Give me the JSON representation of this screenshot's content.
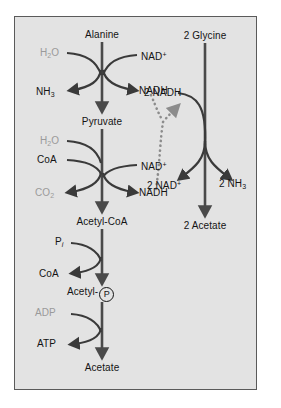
{
  "figure": {
    "panel": {
      "background_color": "#e3e3e3",
      "border_color": "#5a5a5a",
      "page_background": "#ffffff"
    },
    "colors": {
      "arrow_main": "#4a4a4a",
      "arrow_branch": "#3a3a3a",
      "text_primary": "#141414",
      "text_secondary_gray": "#9a9a9a",
      "dotted_connector": "#8c8c8c"
    },
    "pathways": {
      "left": {
        "name": "alanine-to-acetate-pathway",
        "metabolites": [
          {
            "id": "alanine",
            "label": "Alanine"
          },
          {
            "id": "pyruvate",
            "label": "Pyruvate"
          },
          {
            "id": "acetyl-coa",
            "label": "Acetyl-CoA"
          },
          {
            "id": "acetyl-phosphate",
            "label": "Acetyl-",
            "circle_glyph": "P"
          },
          {
            "id": "acetate",
            "label": "Acetate"
          }
        ],
        "steps": [
          {
            "id": "alanine-dehydrogenase",
            "substrate_in_left": "H2O",
            "substrate_in_left_html": "H<sub>2</sub>O",
            "substrate_in_right": "NAD+",
            "substrate_in_right_html": "NAD<sup>+</sup>",
            "product_out_left": "NH3",
            "product_out_left_html": "NH<sub>3</sub>",
            "product_out_right": "NADH"
          },
          {
            "id": "pyruvate-dehydrogenase",
            "substrate_in_left_a": "H2O",
            "substrate_in_left_a_html": "H<sub>2</sub>O",
            "substrate_in_left_b": "CoA",
            "substrate_in_right": "NAD+",
            "substrate_in_right_html": "NAD<sup>+</sup>",
            "product_out_left": "CO2",
            "product_out_left_html": "CO<sub>2</sub>",
            "product_out_right": "NADH"
          },
          {
            "id": "phosphotransacetylase",
            "substrate_in_left": "Pi",
            "substrate_in_left_html": "P<span class=\"ital-sub\">i</span>",
            "product_out_left": "CoA"
          },
          {
            "id": "acetate-kinase",
            "substrate_in_left": "ADP",
            "product_out_left": "ATP"
          }
        ]
      },
      "right": {
        "name": "glycine-to-acetate-pathway",
        "metabolites": [
          {
            "id": "glycine",
            "label": "2 Glycine"
          },
          {
            "id": "acetate-right",
            "label": "2 Acetate"
          }
        ],
        "steps": [
          {
            "id": "glycine-reductase",
            "substrate_in_left": "2 NADH",
            "product_out_left": "2 NAD+",
            "product_out_left_html": "2 NAD<sup>+</sup>",
            "product_out_right": "2 NH3",
            "product_out_right_html": "2 NH<sub>3</sub>"
          }
        ]
      }
    },
    "connector": {
      "name": "nadh-transfer-connector",
      "style": "dotted",
      "from_labels": [
        "NADH",
        "NADH"
      ],
      "to_label": "2 NADH",
      "arrowhead": true
    }
  }
}
